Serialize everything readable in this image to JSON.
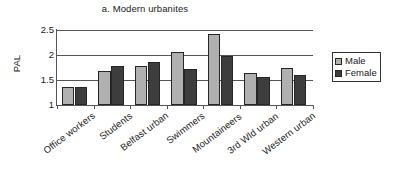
{
  "chart_data": {
    "type": "bar",
    "title": "a. Modern urbanites",
    "xlabel": "",
    "ylabel": "PAL",
    "ylim": [
      1,
      2.5
    ],
    "yticks": [
      "1",
      "1.5",
      "2",
      "2.5"
    ],
    "grid": true,
    "legend_position": "right",
    "categories": [
      "Office workers",
      "Students",
      "Belfast urban",
      "Swimmers",
      "Mountaineers",
      "3rd Wld urban",
      "Western urban"
    ],
    "series": [
      {
        "name": "Male",
        "color": "#b0b0b0",
        "values": [
          1.37,
          1.69,
          1.78,
          2.07,
          2.43,
          1.65,
          1.74
        ]
      },
      {
        "name": "Female",
        "color": "#3d3d3d",
        "values": [
          1.37,
          1.78,
          1.86,
          1.73,
          1.98,
          1.57,
          1.61
        ]
      }
    ]
  },
  "legend": {
    "entries": [
      {
        "label": "Male"
      },
      {
        "label": "Female"
      }
    ]
  },
  "colors": {
    "male": "#b0b0b0",
    "female": "#3d3d3d",
    "axis": "#555555",
    "text": "#1a1a1a"
  }
}
